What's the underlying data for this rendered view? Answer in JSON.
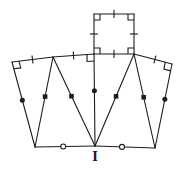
{
  "diagram": {
    "colors": {
      "line": "#1c1c1c",
      "background": "#ffffff"
    },
    "stroke_width": 1.1,
    "label": {
      "text": "I"
    },
    "points": {
      "sq_tl": [
        94,
        14
      ],
      "sq_tr": [
        134,
        14
      ],
      "sq_br": [
        134,
        54
      ],
      "sq_bl": [
        94,
        54
      ],
      "left_outer": [
        12,
        62
      ],
      "left_peak": [
        53,
        57
      ],
      "right_outer": [
        172,
        64
      ],
      "bottom_left": [
        35,
        147
      ],
      "bottom_center": [
        95,
        146
      ],
      "bottom_right": [
        155,
        148
      ]
    },
    "segments": [
      {
        "from": "sq_tl",
        "to": "sq_tr",
        "marker": {
          "type": "tick",
          "t": 0.5
        }
      },
      {
        "from": "sq_tr",
        "to": "sq_br",
        "marker": {
          "type": "tick",
          "t": 0.5
        }
      },
      {
        "from": "sq_br",
        "to": "sq_bl",
        "marker": {
          "type": "tick",
          "t": 0.5
        }
      },
      {
        "from": "sq_bl",
        "to": "sq_tl",
        "marker": {
          "type": "tick",
          "t": 0.5
        }
      },
      {
        "from": "left_peak",
        "to": "sq_bl",
        "marker": {
          "type": "tick",
          "t": 0.5
        }
      },
      {
        "from": "left_outer",
        "to": "left_peak",
        "marker": {
          "type": "tick",
          "t": 0.5
        }
      },
      {
        "from": "sq_br",
        "to": "right_outer",
        "marker": {
          "type": "tick",
          "t": 0.55
        }
      },
      {
        "from": "left_outer",
        "to": "bottom_left",
        "marker": {
          "type": "dot",
          "t": 0.45
        }
      },
      {
        "from": "right_outer",
        "to": "bottom_right",
        "marker": {
          "type": "dot",
          "t": 0.42
        }
      },
      {
        "from": "sq_bl",
        "to": "bottom_center",
        "marker": {
          "type": "dot",
          "t": 0.4
        }
      },
      {
        "from": "left_peak",
        "to": "bottom_left",
        "marker": {
          "type": "square",
          "t": 0.44
        }
      },
      {
        "from": "left_peak",
        "to": "bottom_center",
        "marker": {
          "type": "square",
          "t": 0.44
        }
      },
      {
        "from": "sq_br",
        "to": "bottom_center",
        "marker": {
          "type": "square",
          "t": 0.46
        }
      },
      {
        "from": "sq_br",
        "to": "bottom_right",
        "marker": {
          "type": "square",
          "t": 0.46
        }
      },
      {
        "from": "bottom_left",
        "to": "bottom_center",
        "marker": {
          "type": "open-circle",
          "t": 0.47
        }
      },
      {
        "from": "bottom_center",
        "to": "bottom_right",
        "marker": {
          "type": "open-circle",
          "t": 0.45
        }
      }
    ],
    "right_angles": [
      {
        "vertex": "sq_tl",
        "toward": [
          "sq_tr",
          "sq_bl"
        ],
        "size": 6
      },
      {
        "vertex": "sq_tr",
        "toward": [
          "sq_tl",
          "sq_br"
        ],
        "size": 6
      },
      {
        "vertex": "sq_br",
        "toward": [
          "sq_tr",
          "sq_bl"
        ],
        "size": 6
      },
      {
        "vertex": "sq_bl",
        "toward": [
          "sq_br",
          "sq_tl"
        ],
        "size": 6
      },
      {
        "vertex": "sq_bl",
        "toward": [
          "left_peak",
          "bottom_center"
        ],
        "size": 7
      },
      {
        "vertex": "left_outer",
        "toward": [
          "left_peak",
          "bottom_left"
        ],
        "size": 7
      },
      {
        "vertex": "right_outer",
        "toward": [
          "sq_br",
          "bottom_right"
        ],
        "size": 7
      }
    ],
    "marker_styles": {
      "tick_half_length": 4,
      "dot_radius": 2.5,
      "square_size": 4.6,
      "open_circle_radius": 2.5
    }
  }
}
